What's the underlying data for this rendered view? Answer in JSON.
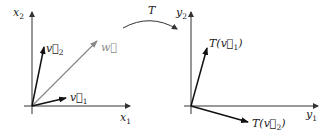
{
  "diagram": {
    "transform_label": "T",
    "left_plane": {
      "x_axis_label": "x",
      "x_axis_sub": "1",
      "y_axis_label": "x",
      "y_axis_sub": "2",
      "vectors": [
        {
          "name": "v",
          "sub": "1",
          "color": "#111111"
        },
        {
          "name": "v",
          "sub": "2",
          "color": "#111111"
        },
        {
          "name": "w",
          "sub": "",
          "color": "#8a8a8a"
        }
      ]
    },
    "right_plane": {
      "x_axis_label": "y",
      "x_axis_sub": "1",
      "y_axis_label": "y",
      "y_axis_sub": "2",
      "vectors": [
        {
          "label_prefix": "T(",
          "name": "v",
          "sub": "1",
          "label_suffix": ")",
          "color": "#111111"
        },
        {
          "label_prefix": "T(",
          "name": "v",
          "sub": "2",
          "label_suffix": ")",
          "color": "#111111"
        }
      ]
    },
    "colors": {
      "axis": "#333333",
      "vector": "#111111",
      "w_vector": "#8a8a8a"
    }
  }
}
